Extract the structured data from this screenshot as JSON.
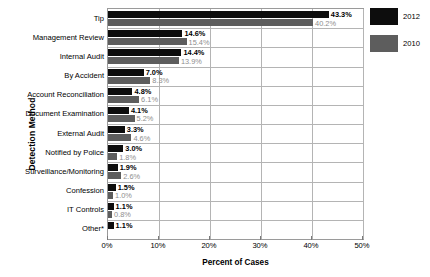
{
  "chart_data": {
    "type": "bar",
    "orientation": "horizontal",
    "title": "",
    "xlabel": "Percent of Cases",
    "ylabel": "Detection Method",
    "xlim": [
      0,
      50
    ],
    "xticks": [
      "0%",
      "10%",
      "20%",
      "30%",
      "40%",
      "50%"
    ],
    "xtick_values": [
      0,
      10,
      20,
      30,
      40,
      50
    ],
    "grid": true,
    "legend_position": "right",
    "categories": [
      "Tip",
      "Management Review",
      "Internal Audit",
      "By Accident",
      "Account Reconciliation",
      "Document Examination",
      "External Audit",
      "Notified by Police",
      "Surveillance/Monitoring",
      "Confession",
      "IT Controls",
      "Other*"
    ],
    "series": [
      {
        "name": "2012",
        "color": "#0d0d0d",
        "values": [
          43.3,
          14.6,
          14.4,
          7.0,
          4.8,
          4.1,
          3.3,
          3.0,
          1.9,
          1.5,
          1.1,
          1.1
        ],
        "labels": [
          "43.3%",
          "14.6%",
          "14.4%",
          "7.0%",
          "4.8%",
          "4.1%",
          "3.3%",
          "3.0%",
          "1.9%",
          "1.5%",
          "1.1%",
          "1.1%"
        ]
      },
      {
        "name": "2010",
        "color": "#5d5d5d",
        "values": [
          40.2,
          15.4,
          13.9,
          8.3,
          6.1,
          5.2,
          4.6,
          1.8,
          2.6,
          1.0,
          0.8,
          null
        ],
        "labels": [
          "40.2%",
          "15.4%",
          "13.9%",
          "8.3%",
          "6.1%",
          "5.2%",
          "4.6%",
          "1.8%",
          "2.6%",
          "1.0%",
          "0.8%",
          ""
        ]
      }
    ]
  },
  "legend": {
    "items": [
      {
        "label": "2012",
        "color": "#0d0d0d"
      },
      {
        "label": "2010",
        "color": "#5d5d5d"
      }
    ]
  }
}
